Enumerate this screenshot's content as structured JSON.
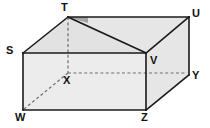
{
  "figure": {
    "name": "prism-solid-diagram",
    "background_color": "#ffffff",
    "colors": {
      "face_light": "#ececed",
      "face_mid": "#e6e6e7",
      "face_shade": "#e2e2e3",
      "angle_marker": "#a6a6a6",
      "edge": "#1a1a1a",
      "hidden_edge": "#6e6e6e",
      "label": "#111111"
    },
    "stroke_width": 1.6,
    "hidden_stroke_width": 1.2,
    "hidden_dash": "3,2.4"
  },
  "vertices": [
    {
      "id": "T",
      "label": "T",
      "x": 68,
      "y": 17,
      "label_x": 61,
      "label_y": 2,
      "hidden": false
    },
    {
      "id": "U",
      "label": "U",
      "x": 189,
      "y": 17,
      "label_x": 192,
      "label_y": 8,
      "hidden": false
    },
    {
      "id": "S",
      "label": "S",
      "x": 23,
      "y": 53,
      "label_x": 6,
      "label_y": 45,
      "hidden": false
    },
    {
      "id": "V",
      "label": "V",
      "x": 146,
      "y": 53,
      "label_x": 150,
      "label_y": 55,
      "hidden": false
    },
    {
      "id": "Y",
      "label": "Y",
      "x": 189,
      "y": 75,
      "label_x": 192,
      "label_y": 70,
      "hidden": false
    },
    {
      "id": "X",
      "label": "X",
      "x": 68,
      "y": 73,
      "label_x": 63,
      "label_y": 75,
      "hidden": true
    },
    {
      "id": "W",
      "label": "W",
      "x": 23,
      "y": 110,
      "label_x": 15,
      "label_y": 112,
      "hidden": false
    },
    {
      "id": "Z",
      "label": "Z",
      "x": 146,
      "y": 110,
      "label_x": 141,
      "label_y": 112,
      "hidden": false
    }
  ],
  "faces": [
    {
      "name": "front-face",
      "points": "23,53 146,53 146,110 23,110",
      "fill": "#ececed"
    },
    {
      "name": "right-face",
      "points": "146,53 189,17 189,75 146,110",
      "fill": "#e6e6e7"
    },
    {
      "name": "roof-right-panel",
      "points": "68,17 189,17 146,53",
      "fill": "#e6e6e7"
    },
    {
      "name": "roof-left-panel",
      "points": "68,17 146,53 23,53",
      "fill": "#e2e2e3"
    }
  ],
  "angle_marker": {
    "name": "right-angle-shaded-wedge",
    "points": "68,17 88,17 88,23",
    "fill": "#a6a6a6"
  },
  "solid_edges": [
    {
      "name": "edge-T-U",
      "from": "T",
      "to": "U",
      "x1": 68,
      "y1": 17,
      "x2": 189,
      "y2": 17
    },
    {
      "name": "edge-T-S",
      "from": "T",
      "to": "S",
      "x1": 68,
      "y1": 17,
      "x2": 23,
      "y2": 53
    },
    {
      "name": "edge-T-V",
      "from": "T",
      "to": "V",
      "x1": 68,
      "y1": 17,
      "x2": 146,
      "y2": 53
    },
    {
      "name": "edge-U-V",
      "from": "U",
      "to": "V",
      "x1": 189,
      "y1": 17,
      "x2": 146,
      "y2": 53
    },
    {
      "name": "edge-U-Y",
      "from": "U",
      "to": "Y",
      "x1": 189,
      "y1": 17,
      "x2": 189,
      "y2": 75
    },
    {
      "name": "edge-S-V",
      "from": "S",
      "to": "V",
      "x1": 23,
      "y1": 53,
      "x2": 146,
      "y2": 53
    },
    {
      "name": "edge-S-W",
      "from": "S",
      "to": "W",
      "x1": 23,
      "y1": 53,
      "x2": 23,
      "y2": 110
    },
    {
      "name": "edge-V-Z",
      "from": "V",
      "to": "Z",
      "x1": 146,
      "y1": 53,
      "x2": 146,
      "y2": 110
    },
    {
      "name": "edge-W-Z",
      "from": "W",
      "to": "Z",
      "x1": 23,
      "y1": 110,
      "x2": 146,
      "y2": 110
    },
    {
      "name": "edge-Z-Y",
      "from": "Z",
      "to": "Y",
      "x1": 146,
      "y1": 110,
      "x2": 189,
      "y2": 75
    }
  ],
  "hidden_edges": [
    {
      "name": "hidden-edge-T-X",
      "from": "T",
      "to": "X",
      "x1": 68,
      "y1": 17,
      "x2": 68,
      "y2": 73
    },
    {
      "name": "hidden-edge-X-Y",
      "from": "X",
      "to": "Y",
      "x1": 68,
      "y1": 73,
      "x2": 187,
      "y2": 73
    },
    {
      "name": "hidden-edge-X-W",
      "from": "X",
      "to": "W",
      "x1": 68,
      "y1": 73,
      "x2": 24,
      "y2": 109
    }
  ]
}
